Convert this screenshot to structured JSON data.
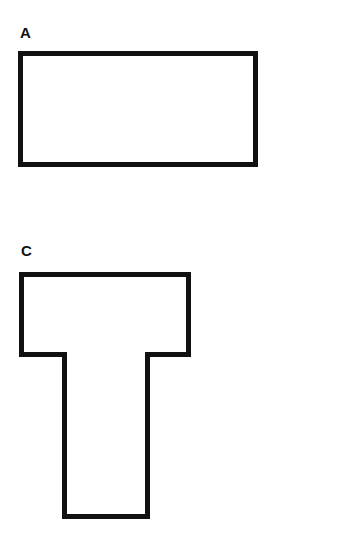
{
  "figures": [
    {
      "label": "A",
      "shape": "rectangle"
    },
    {
      "label": "C",
      "shape": "T-shape"
    }
  ],
  "colors": {
    "stroke": "#111111",
    "fill": "#ffffff",
    "background": "#ffffff"
  }
}
